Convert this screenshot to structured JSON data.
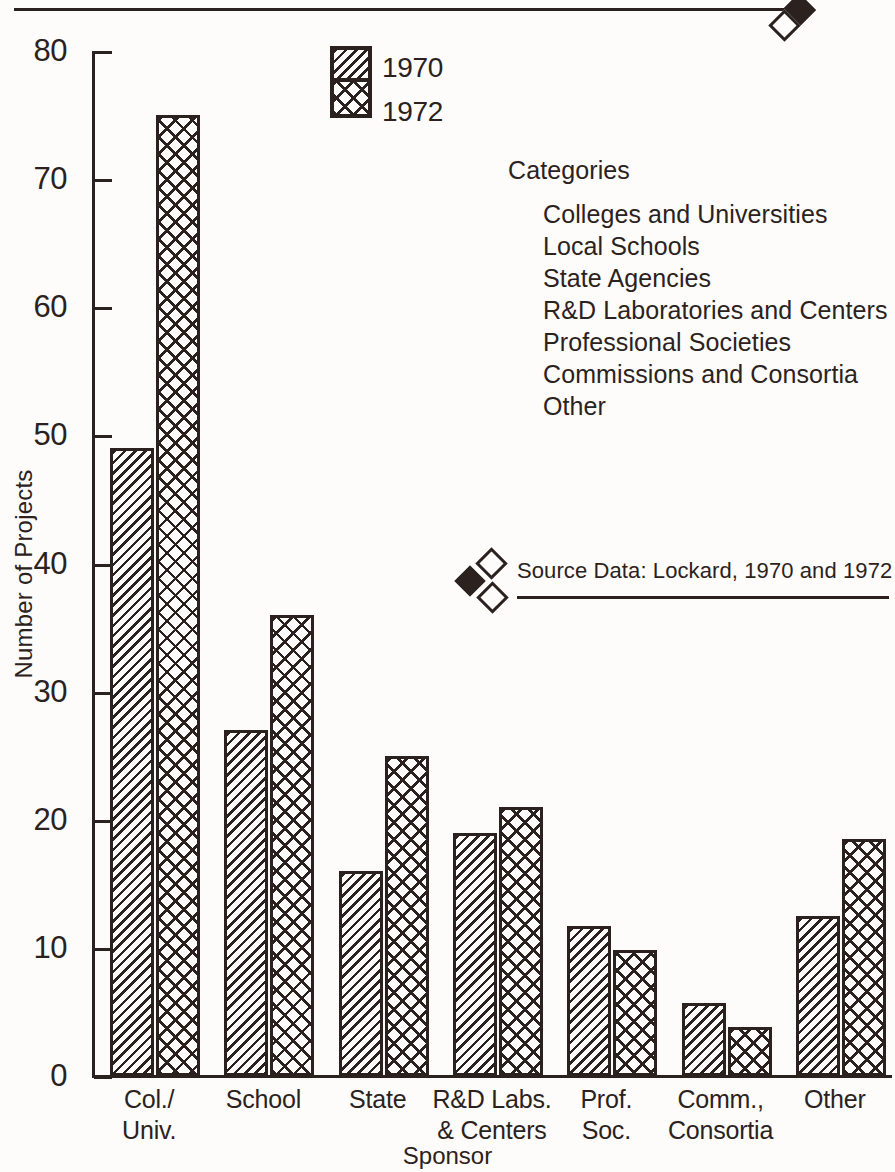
{
  "chart_data": {
    "type": "bar",
    "title": "",
    "xlabel": "Sponsor",
    "ylabel": "Number of Projects",
    "ylim": [
      0,
      80
    ],
    "ytick_values": [
      80,
      70,
      60,
      50,
      40,
      30,
      20,
      10,
      0
    ],
    "ytick_labels": [
      "80",
      "70",
      "60",
      "50",
      "40",
      "30",
      "20",
      "10",
      "0"
    ],
    "grid": false,
    "legend_position": "top-center",
    "categories": [
      "Col./ Univ.",
      "School",
      "State",
      "R&D Labs. & Centers",
      "Prof. Soc.",
      "Comm., Consortia",
      "Other"
    ],
    "category_lines": [
      [
        "Col./",
        "Univ."
      ],
      [
        "School",
        ""
      ],
      [
        "State",
        ""
      ],
      [
        "R&D Labs.",
        "& Centers"
      ],
      [
        "Prof.",
        "Soc."
      ],
      [
        "Comm.,",
        "Consortia"
      ],
      [
        "Other",
        ""
      ]
    ],
    "series": [
      {
        "name": "1970",
        "pattern": "diagonal-hatch",
        "values": [
          49,
          27,
          16,
          19,
          11.7,
          5.7,
          12.5
        ]
      },
      {
        "name": "1972",
        "pattern": "cross-hatch",
        "values": [
          75,
          36,
          25,
          21,
          9.8,
          3.8,
          18.5
        ]
      }
    ]
  },
  "legend": {
    "items": [
      {
        "label": "1970",
        "pattern": "diagonal-hatch"
      },
      {
        "label": "1972",
        "pattern": "cross-hatch"
      }
    ]
  },
  "categories_panel": {
    "heading": "Categories",
    "items": [
      "Colleges and Universities",
      "Local Schools",
      "State Agencies",
      "R&D Laboratories and Centers",
      "Professional Societies",
      "Commissions and Consortia",
      "Other"
    ]
  },
  "source_note": {
    "text": "Source Data:   Lockard, 1970 and 1972"
  },
  "colors": {
    "ink": "#2b2220",
    "paper": "#fdfcfa"
  }
}
